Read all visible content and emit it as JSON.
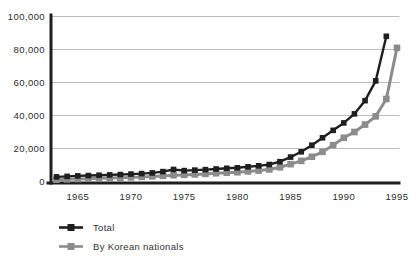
{
  "chart_data": {
    "type": "line",
    "title": "",
    "x_unit": "year",
    "x_ticks": [
      "1965",
      "1970",
      "1975",
      "1980",
      "1985",
      "1990",
      "1995"
    ],
    "y_ticks": [
      "0",
      "20,000",
      "40,000",
      "60,000",
      "80,000",
      "100,000"
    ],
    "y_tick_values": [
      0,
      20000,
      40000,
      60000,
      80000,
      100000
    ],
    "xlim": [
      1963,
      1995
    ],
    "ylim": [
      0,
      100000
    ],
    "grid": "horizontal-light",
    "legend_position": "bottom-left",
    "colors": {
      "axis": "#1f1f1f",
      "grid": "#b6b6b6",
      "tick_text": "#2d2d2d"
    },
    "series": [
      {
        "name": "Total",
        "color": "#1f1f1f",
        "marker": "square",
        "x_start": 1963,
        "x_end": 1994,
        "values": [
          2800,
          3100,
          3400,
          3600,
          3800,
          4000,
          4200,
          4500,
          4800,
          5200,
          6000,
          7300,
          6600,
          6900,
          7200,
          7600,
          8000,
          8300,
          8900,
          9500,
          10300,
          12000,
          14800,
          18000,
          22000,
          26500,
          31000,
          35500,
          41000,
          49000,
          61000,
          88000
        ]
      },
      {
        "name": "By Korean nationals",
        "color": "#8c8c8c",
        "marker": "square",
        "x_start": 1963,
        "x_end": 1995,
        "values": [
          1100,
          1300,
          1500,
          1700,
          1900,
          2100,
          2300,
          2500,
          2800,
          3100,
          3400,
          3800,
          4000,
          4300,
          4600,
          5000,
          5300,
          5600,
          6100,
          6600,
          7300,
          8600,
          10500,
          12500,
          15000,
          18000,
          22000,
          26500,
          30000,
          34500,
          39500,
          50000,
          81000
        ]
      }
    ]
  }
}
